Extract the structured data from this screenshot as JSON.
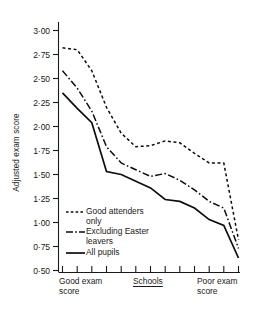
{
  "figure": {
    "axis_color": "#1a1a1a",
    "line_color": "#0d0d0d"
  },
  "chart_data": {
    "type": "line",
    "title": "",
    "xlabel": "Schools",
    "ylabel": "Adjusted exam score",
    "ylim": [
      0.5,
      3.0
    ],
    "ytick_labels": [
      "3·00",
      "2·75",
      "2·50",
      "2·25",
      "2·00",
      "1·75",
      "1·50",
      "1·25",
      "1·00",
      "0·75",
      "0·50"
    ],
    "ytick_values": [
      3.0,
      2.75,
      2.5,
      2.25,
      2.0,
      1.75,
      1.5,
      1.25,
      1.0,
      0.75,
      0.5
    ],
    "grid": false,
    "legend_position": "lower-left-inside",
    "x_axis_left_caption": "Good exam\nscore",
    "x_axis_mid_caption": "Schools",
    "x_axis_right_caption": "Poor exam\nscore",
    "x_tick_count": 13,
    "categories": [
      "1",
      "2",
      "3",
      "4",
      "5",
      "6",
      "7",
      "8",
      "9",
      "10",
      "11",
      "12",
      "13"
    ],
    "series": [
      {
        "name": "Good attenders only",
        "style": "dotted",
        "values": [
          2.82,
          2.8,
          2.58,
          2.2,
          1.93,
          1.79,
          1.8,
          1.85,
          1.83,
          1.72,
          1.62,
          1.62,
          0.82
        ]
      },
      {
        "name": "Excluding Easter leavers",
        "style": "dash-dot",
        "values": [
          2.58,
          2.4,
          2.16,
          1.79,
          1.62,
          1.55,
          1.48,
          1.51,
          1.44,
          1.34,
          1.22,
          1.15,
          0.73
        ]
      },
      {
        "name": "All pupils",
        "style": "solid",
        "values": [
          2.35,
          2.19,
          2.04,
          1.53,
          1.5,
          1.43,
          1.36,
          1.24,
          1.22,
          1.15,
          1.03,
          0.97,
          0.63
        ]
      }
    ]
  },
  "legend": {
    "items": [
      {
        "label": "Good attenders\nonly",
        "style": "dotted"
      },
      {
        "label": "Excluding Easter\nleavers",
        "style": "dash-dot"
      },
      {
        "label": "All pupils",
        "style": "solid"
      }
    ]
  }
}
